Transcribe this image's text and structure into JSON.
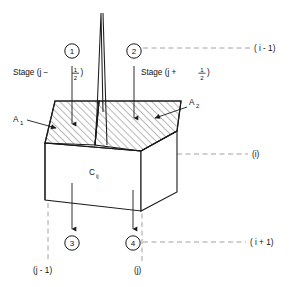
{
  "figure": {
    "stage_labels": {
      "left": "Stage (j − ½)",
      "left_prefix": "Stage (j − ",
      "left_num": "1",
      "left_den": "2",
      "left_suffix": ")",
      "right": "Stage (j + ½)",
      "right_prefix": "Stage (j + ",
      "right_num": "1",
      "right_den": "2",
      "right_suffix": ")"
    },
    "area_labels": [
      {
        "name": "A1",
        "base": "A",
        "sub": "1"
      },
      {
        "name": "A2",
        "base": "A",
        "sub": "2"
      }
    ],
    "cell_label": {
      "base": "C",
      "sub": "ij"
    },
    "flow_markers": [
      {
        "id": "1",
        "label": "1",
        "direction": "in",
        "position": "top-left"
      },
      {
        "id": "2",
        "label": "2",
        "direction": "in",
        "position": "top-right"
      },
      {
        "id": "3",
        "label": "3",
        "direction": "out",
        "position": "bottom-left"
      },
      {
        "id": "4",
        "label": "4",
        "direction": "out",
        "position": "bottom-right"
      }
    ],
    "row_indices": [
      {
        "id": "i-minus-1",
        "label": "( i - 1)"
      },
      {
        "id": "i",
        "label": "(i)"
      },
      {
        "id": "i-plus-1",
        "label": "( i + 1)"
      }
    ],
    "column_indices": [
      {
        "id": "j-minus-1",
        "label": "(j - 1)"
      },
      {
        "id": "j",
        "label": "(j)"
      }
    ],
    "colors": {
      "line": "#1a1a1a",
      "hatch": "#4d4d4d",
      "dashed": "#8c8c8c",
      "background": "#ffffff"
    }
  }
}
